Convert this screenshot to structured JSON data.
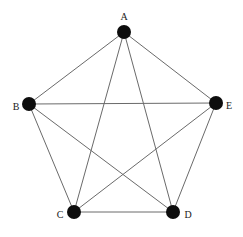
{
  "figure": {
    "kind": "graph-diagram",
    "width": 243,
    "height": 237,
    "background_color": "#ffffff"
  },
  "style": {
    "edge_color": "#6a6a6a",
    "edge_width": 1,
    "node_color": "#0d0d0d",
    "node_radius": 7,
    "label_color": "#1a1a1a",
    "label_font_size": 10
  },
  "chart_data": {
    "type": "diagram",
    "graph_type": "complete-graph",
    "title": "",
    "node_count": 5,
    "edge_count": 10,
    "nodes": [
      {
        "id": "A",
        "label": "A",
        "x": 124,
        "y": 32,
        "label_x": 124,
        "label_y": 18,
        "label_anchor": "middle"
      },
      {
        "id": "B",
        "label": "B",
        "x": 29,
        "y": 104,
        "label_x": 16,
        "label_y": 108,
        "label_anchor": "middle"
      },
      {
        "id": "C",
        "label": "C",
        "x": 74,
        "y": 212,
        "label_x": 60,
        "label_y": 216,
        "label_anchor": "middle"
      },
      {
        "id": "D",
        "label": "D",
        "x": 173,
        "y": 212,
        "label_x": 188,
        "label_y": 216,
        "label_anchor": "middle"
      },
      {
        "id": "E",
        "label": "E",
        "x": 216,
        "y": 103,
        "label_x": 229,
        "label_y": 107,
        "label_anchor": "middle"
      }
    ],
    "edges": [
      {
        "from": "A",
        "to": "B"
      },
      {
        "from": "A",
        "to": "C"
      },
      {
        "from": "A",
        "to": "D"
      },
      {
        "from": "A",
        "to": "E"
      },
      {
        "from": "B",
        "to": "C"
      },
      {
        "from": "B",
        "to": "D"
      },
      {
        "from": "B",
        "to": "E"
      },
      {
        "from": "C",
        "to": "D"
      },
      {
        "from": "C",
        "to": "E"
      },
      {
        "from": "D",
        "to": "E"
      }
    ]
  }
}
